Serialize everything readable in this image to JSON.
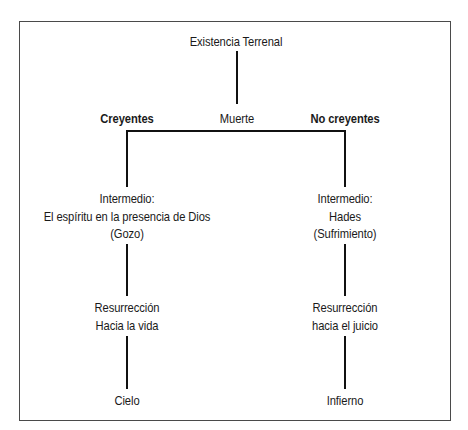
{
  "diagram": {
    "root": "Existencia Terrenal",
    "junction": "Muerte",
    "branches": [
      {
        "heading": "Creyentes",
        "intermediate": [
          "Intermedio:",
          "El espíritu en la presencia de Dios",
          "(Gozo)"
        ],
        "resurrection": [
          "Resurrección",
          "Hacia la vida"
        ],
        "destination": "Cielo"
      },
      {
        "heading": "No creyentes",
        "intermediate": [
          "Intermedio:",
          "Hades",
          "(Sufrimiento)"
        ],
        "resurrection": [
          "Resurrección",
          "hacia el juicio"
        ],
        "destination": "Infierno"
      }
    ]
  },
  "colors": {
    "line": "#111111",
    "border": "#4a4a4a",
    "text": "#1a1a1a",
    "background": "#ffffff"
  }
}
